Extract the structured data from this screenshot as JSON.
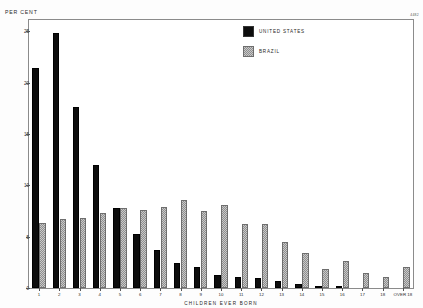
{
  "chart_data": {
    "type": "bar",
    "title": "",
    "xlabel": "CHILDREN  EVER  BORN",
    "ylabel": "PER CENT",
    "ylim": [
      0,
      26.1
    ],
    "yticks": [
      0,
      5,
      10,
      15,
      20,
      25
    ],
    "ytick_labels": [
      "0",
      "5",
      "10",
      "15",
      "20",
      "25"
    ],
    "grid": false,
    "legend_position": "top-right",
    "categories": [
      "1",
      "2",
      "3",
      "4",
      "5",
      "6",
      "7",
      "8",
      "9",
      "10",
      "11",
      "12",
      "13",
      "14",
      "15",
      "16",
      "17",
      "18",
      "OVER 18"
    ],
    "series": [
      {
        "name": "UNITED STATES",
        "color": "#0d0d0d",
        "values": [
          21.4,
          24.8,
          17.6,
          12.0,
          7.8,
          5.3,
          3.7,
          2.4,
          2.0,
          1.3,
          1.1,
          1.0,
          0.7,
          0.4,
          0.2,
          0.2,
          0.0,
          0.0,
          0.0
        ]
      },
      {
        "name": "BRAZIL",
        "color": "#c9c9c9",
        "values": [
          6.3,
          6.7,
          6.8,
          7.3,
          7.8,
          7.6,
          7.9,
          8.6,
          7.5,
          8.1,
          6.2,
          6.2,
          4.5,
          3.4,
          1.9,
          2.6,
          1.5,
          1.1,
          2.0
        ]
      }
    ]
  },
  "annotations": {
    "corner_code": "4482"
  },
  "legend": {
    "entries": [
      {
        "label": "UNITED  STATES",
        "swatch": "solid-black"
      },
      {
        "label": "BRAZIL",
        "swatch": "hatched-gray"
      }
    ]
  }
}
